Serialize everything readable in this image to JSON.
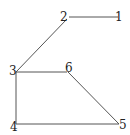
{
  "graph": {
    "nodes": [
      {
        "id": "1",
        "label": "1",
        "x": 118,
        "y": 17
      },
      {
        "id": "2",
        "label": "2",
        "x": 67,
        "y": 17
      },
      {
        "id": "3",
        "label": "3",
        "x": 16,
        "y": 71
      },
      {
        "id": "4",
        "label": "4",
        "x": 16,
        "y": 124
      },
      {
        "id": "5",
        "label": "5",
        "x": 121,
        "y": 124
      },
      {
        "id": "6",
        "label": "6",
        "x": 67,
        "y": 71
      }
    ],
    "edges": [
      {
        "from": "2",
        "to": "1"
      },
      {
        "from": "2",
        "to": "3"
      },
      {
        "from": "3",
        "to": "6"
      },
      {
        "from": "3",
        "to": "4"
      },
      {
        "from": "4",
        "to": "5"
      },
      {
        "from": "6",
        "to": "5"
      }
    ]
  }
}
